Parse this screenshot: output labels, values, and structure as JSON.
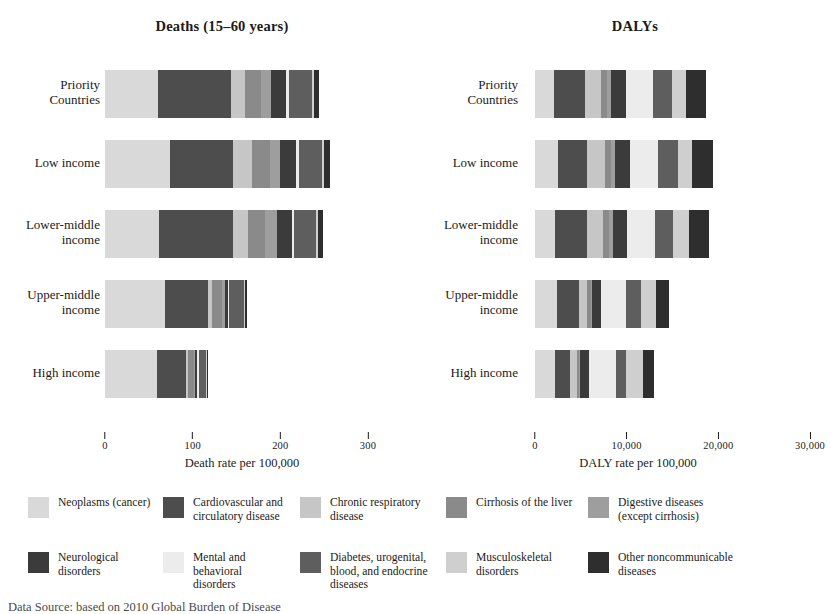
{
  "chart_data": [
    {
      "type": "bar",
      "orientation": "horizontal",
      "stacked": true,
      "title": "Deaths (15–60 years)",
      "xlabel": "Death rate per 100,000",
      "ylabel": "",
      "xlim": [
        0,
        300
      ],
      "xticks": [
        0,
        100,
        200,
        300
      ],
      "xticklabels": [
        "0",
        "100",
        "200",
        "300"
      ],
      "grid": false,
      "categories": [
        "Priority\nCountries",
        "Low income",
        "Lower-middle\nincome",
        "Upper-middle\nincome",
        "High income"
      ],
      "series": [
        {
          "name": "Neoplasms (cancer)",
          "color": "#d9d9d9",
          "values": [
            60,
            74,
            62,
            68,
            59
          ]
        },
        {
          "name": "Cardiovascular and circulatory disease",
          "color": "#4d4d4d",
          "values": [
            84,
            72,
            84,
            50,
            33
          ]
        },
        {
          "name": "Chronic respiratory disease",
          "color": "#c6c6c6",
          "values": [
            16,
            22,
            17,
            4,
            3
          ]
        },
        {
          "name": "Cirrhosis of the liver",
          "color": "#8a8a8a",
          "values": [
            18,
            20,
            19,
            12,
            6
          ]
        },
        {
          "name": "Digestive diseases (except cirrhosis)",
          "color": "#9e9e9e",
          "values": [
            11,
            12,
            14,
            3,
            2
          ]
        },
        {
          "name": "Neurological disorders",
          "color": "#3b3b3b",
          "values": [
            18,
            18,
            17,
            3,
            2
          ]
        },
        {
          "name": "Mental and behavioral disorders",
          "color": "#ececec",
          "values": [
            3,
            3,
            3,
            2,
            2
          ]
        },
        {
          "name": "Diabetes, urogenital, blood, and endocrine diseases",
          "color": "#5e5e5e",
          "values": [
            26,
            27,
            25,
            17,
            8
          ]
        },
        {
          "name": "Musculoskeletal disorders",
          "color": "#cfcfcf",
          "values": [
            2,
            2,
            2,
            1,
            1
          ]
        },
        {
          "name": "Other noncommunicable diseases",
          "color": "#2e2e2e",
          "values": [
            6,
            7,
            6,
            2,
            2
          ]
        }
      ],
      "totals": [
        244,
        257,
        249,
        162,
        118
      ]
    },
    {
      "type": "bar",
      "orientation": "horizontal",
      "stacked": true,
      "title": "DALYs",
      "xlabel": "DALY rate per 100,000",
      "ylabel": "",
      "xlim": [
        0,
        30000
      ],
      "xticks": [
        0,
        10000,
        20000,
        30000
      ],
      "xticklabels": [
        "0",
        "10,000",
        "20,000",
        "30,000"
      ],
      "grid": false,
      "categories": [
        "Priority\nCountries",
        "Low income",
        "Lower-middle\nincome",
        "Upper-middle\nincome",
        "High income"
      ],
      "series": [
        {
          "name": "Neoplasms (cancer)",
          "color": "#d9d9d9",
          "values": [
            2100,
            2550,
            2200,
            2350,
            2150
          ]
        },
        {
          "name": "Cardiovascular and circulatory disease",
          "color": "#4d4d4d",
          "values": [
            3400,
            3150,
            3500,
            2500,
            1700
          ]
        },
        {
          "name": "Chronic respiratory disease",
          "color": "#c6c6c6",
          "values": [
            1750,
            1950,
            1700,
            800,
            700
          ]
        },
        {
          "name": "Cirrhosis of the liver",
          "color": "#8a8a8a",
          "values": [
            600,
            620,
            640,
            420,
            250
          ]
        },
        {
          "name": "Digestive diseases (except cirrhosis)",
          "color": "#9e9e9e",
          "values": [
            480,
            500,
            520,
            180,
            140
          ]
        },
        {
          "name": "Neurological disorders",
          "color": "#3b3b3b",
          "values": [
            1550,
            1600,
            1500,
            900,
            1000
          ]
        },
        {
          "name": "Mental and behavioral disorders",
          "color": "#ececec",
          "values": [
            3000,
            3100,
            3050,
            2800,
            2900
          ]
        },
        {
          "name": "Diabetes, urogenital, blood, and endocrine diseases",
          "color": "#5e5e5e",
          "values": [
            2050,
            2100,
            2000,
            1600,
            1100
          ]
        },
        {
          "name": "Musculoskeletal disorders",
          "color": "#cfcfcf",
          "values": [
            1600,
            1550,
            1650,
            1700,
            1850
          ]
        },
        {
          "name": "Other noncommunicable diseases",
          "color": "#2e2e2e",
          "values": [
            2150,
            2300,
            2200,
            1400,
            1200
          ]
        }
      ],
      "totals": [
        18680,
        19420,
        18960,
        14650,
        12990
      ]
    }
  ],
  "legend": {
    "entries": [
      {
        "label": "Neoplasms (cancer)",
        "color": "#d9d9d9"
      },
      {
        "label": "Cardiovascular and\ncirculatory disease",
        "color": "#4d4d4d"
      },
      {
        "label": "Chronic respiratory\ndisease",
        "color": "#c6c6c6"
      },
      {
        "label": "Cirrhosis of the liver",
        "color": "#8a8a8a"
      },
      {
        "label": "Digestive diseases\n(except cirrhosis)",
        "color": "#9e9e9e"
      },
      {
        "label": "Neurological\ndisorders",
        "color": "#3b3b3b"
      },
      {
        "label": "Mental and behavioral\ndisorders",
        "color": "#ececec"
      },
      {
        "label": "Diabetes, urogenital,\nblood, and endocrine\ndiseases",
        "color": "#5e5e5e"
      },
      {
        "label": "Musculoskeletal\ndisorders",
        "color": "#cfcfcf"
      },
      {
        "label": "Other noncommunicable\ndiseases",
        "color": "#2e2e2e"
      }
    ]
  },
  "footer": {
    "source_note": "Data Source: based on 2010 Global Burden of Disease"
  }
}
